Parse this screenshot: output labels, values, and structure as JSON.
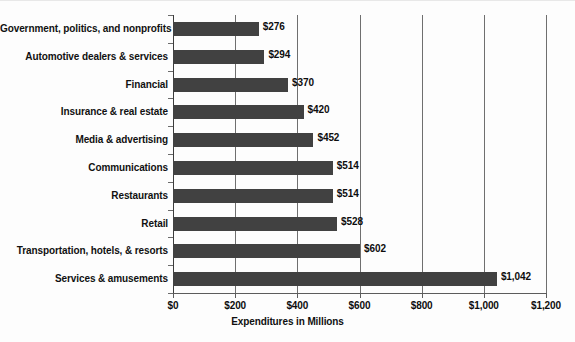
{
  "chart_data": {
    "type": "bar",
    "orientation": "horizontal",
    "title": "",
    "xlabel": "Expenditures in Millions",
    "ylabel": "",
    "xlim": [
      0,
      1200
    ],
    "xticks": [
      0,
      200,
      400,
      600,
      800,
      1000,
      1200
    ],
    "xtick_labels": [
      "$0",
      "$200",
      "$400",
      "$600",
      "$800",
      "$1,000",
      "$1,200"
    ],
    "grid": true,
    "legend": "none",
    "categories": [
      "Government, politics, and nonprofits",
      "Automotive dealers & services",
      "Financial",
      "Insurance & real estate",
      "Media & advertising",
      "Communications",
      "Restaurants",
      "Retail",
      "Transportation, hotels, & resorts",
      "Services & amusements"
    ],
    "values": [
      276,
      294,
      370,
      420,
      452,
      514,
      514,
      528,
      602,
      1042
    ],
    "value_labels": [
      "$276",
      "$294",
      "$370",
      "$420",
      "$452",
      "$514",
      "$514",
      "$528",
      "$602",
      "$1,042"
    ],
    "bar_color": "#414141",
    "gridline_color": "#6f6f6f",
    "text_color": "#111111",
    "background_color": "#fdfdfd"
  }
}
